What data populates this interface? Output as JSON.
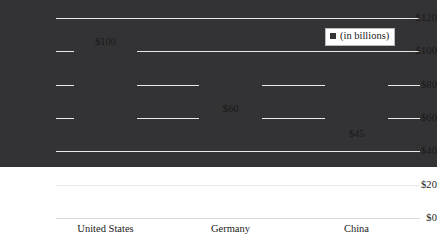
{
  "chart_data": {
    "type": "bar",
    "title": "",
    "xlabel": "",
    "ylabel": "",
    "categories": [
      "United States",
      "Germany",
      "China"
    ],
    "values": [
      100,
      60,
      45
    ],
    "data_labels": [
      "$100",
      "$60",
      "$45"
    ],
    "ylim": [
      0,
      120
    ],
    "ytick_values": [
      0,
      20,
      40,
      60,
      80,
      100,
      120
    ],
    "ytick_labels": [
      "$0",
      "$20",
      "$40",
      "$60",
      "$80",
      "$100",
      "$120"
    ],
    "grid": true,
    "legend": {
      "position": "top-right",
      "entries": [
        {
          "label": "(in billions)",
          "color": "#333335"
        }
      ]
    },
    "series": [
      {
        "name": "(in billions)",
        "color": "#333335",
        "values": [
          100,
          60,
          45
        ]
      }
    ]
  },
  "colors": {
    "bar": "#333335",
    "gridline": "#e9e9e9",
    "baseline": "#d9d9d9",
    "legend_border": "#b9b9b9",
    "text": "#1a1a1a",
    "background": "#ffffff"
  }
}
